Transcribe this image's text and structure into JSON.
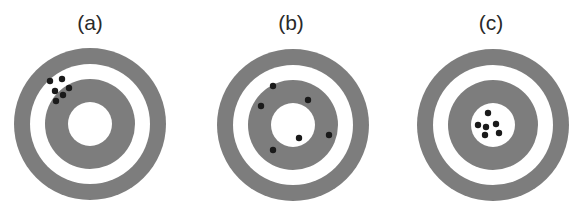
{
  "figure": {
    "ring_color": "#7d7d7d",
    "background_color": "#ffffff",
    "dot_color": "#1a1a1a",
    "panels": [
      {
        "label": "(a)",
        "label_x": 90,
        "center": [
          90,
          124
        ],
        "radii": {
          "outer": 76,
          "outer_white": 60,
          "inner_gray": 45,
          "bullseye_white": 22
        },
        "dots": [
          [
            50,
            81
          ],
          [
            62,
            79
          ],
          [
            55,
            91
          ],
          [
            63,
            95
          ],
          [
            69,
            88
          ],
          [
            56,
            101
          ]
        ]
      },
      {
        "label": "(b)",
        "label_x": 291,
        "center": [
          293,
          125
        ],
        "radii": {
          "outer": 76,
          "outer_white": 60,
          "inner_gray": 45,
          "bullseye_white": 22
        },
        "dots": [
          [
            273,
            86
          ],
          [
            261,
            106
          ],
          [
            308,
            100
          ],
          [
            299,
            138
          ],
          [
            329,
            135
          ],
          [
            273,
            150
          ]
        ]
      },
      {
        "label": "(c)",
        "label_x": 491,
        "center": [
          493,
          125
        ],
        "radii": {
          "outer": 76,
          "outer_white": 60,
          "inner_gray": 45,
          "bullseye_white": 22
        },
        "dots": [
          [
            488,
            113
          ],
          [
            478,
            125
          ],
          [
            486,
            127
          ],
          [
            496,
            124
          ],
          [
            485,
            135
          ],
          [
            499,
            133
          ]
        ]
      }
    ]
  }
}
